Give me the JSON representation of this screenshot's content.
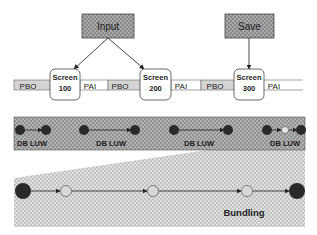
{
  "top_boxes": {
    "input_label": "Input",
    "save_label": "Save"
  },
  "timeline": {
    "segments": [
      "PBO",
      "PAI",
      "PBO",
      "PAI",
      "PBO",
      "PAI"
    ],
    "screens": [
      {
        "line1": "Screen",
        "line2": "100"
      },
      {
        "line1": "Screen",
        "line2": "200"
      },
      {
        "line1": "Screen",
        "line2": "300"
      }
    ]
  },
  "db_band": {
    "luw_labels": [
      "DB LUW",
      "DB LUW",
      "DB LUW",
      "DB LUW"
    ]
  },
  "bundling": {
    "label": "Bundling"
  },
  "colors": {
    "box_fill": "#8c8c8c",
    "band_fill": "#9a9a9a",
    "trapezoid_fill": "#cfcfcf",
    "pbo_fill": "#d4d4d4",
    "node_dark": "#2a2a2a",
    "node_light": "#d8d8d8"
  }
}
